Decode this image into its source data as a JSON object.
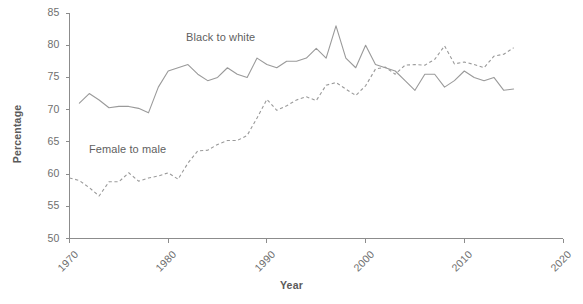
{
  "chart_data": {
    "type": "line",
    "title": "",
    "xlabel": "Year",
    "ylabel": "Percentage",
    "xlim": [
      1970,
      2020
    ],
    "ylim": [
      50,
      85
    ],
    "xticks": [
      1970,
      1980,
      1990,
      2000,
      2010,
      2020
    ],
    "yticks": [
      50,
      55,
      60,
      65,
      70,
      75,
      80,
      85
    ],
    "grid": false,
    "legend_position": "inline-annotation",
    "series": [
      {
        "name": "Black to white",
        "style": "solid",
        "color": "#9a9a9a",
        "annotation": "Black to white",
        "x": [
          1971,
          1972,
          1973,
          1974,
          1975,
          1976,
          1977,
          1978,
          1979,
          1980,
          1981,
          1982,
          1983,
          1984,
          1985,
          1986,
          1987,
          1988,
          1989,
          1990,
          1991,
          1992,
          1993,
          1994,
          1995,
          1996,
          1997,
          1998,
          1999,
          2000,
          2001,
          2002,
          2003,
          2004,
          2005,
          2006,
          2007,
          2008,
          2009,
          2010,
          2011,
          2012,
          2013,
          2014,
          2015
        ],
        "values": [
          71.0,
          72.5,
          71.5,
          70.3,
          70.5,
          70.5,
          70.2,
          69.5,
          73.5,
          76.0,
          76.5,
          77.0,
          75.5,
          74.5,
          75.0,
          76.5,
          75.5,
          75.0,
          78.0,
          77.0,
          76.5,
          77.5,
          77.5,
          78.0,
          79.5,
          78.0,
          83.0,
          78.0,
          76.5,
          80.0,
          77.0,
          76.5,
          76.0,
          74.5,
          73.0,
          75.5,
          75.5,
          73.5,
          74.5,
          76.0,
          75.0,
          74.5,
          75.0,
          73.0,
          73.2
        ]
      },
      {
        "name": "Female to male",
        "style": "dashed",
        "color": "#9a9a9a",
        "annotation": "Female to male",
        "x": [
          1970,
          1971,
          1972,
          1973,
          1974,
          1975,
          1976,
          1977,
          1978,
          1979,
          1980,
          1981,
          1982,
          1983,
          1984,
          1985,
          1986,
          1987,
          1988,
          1989,
          1990,
          1991,
          1992,
          1993,
          1994,
          1995,
          1996,
          1997,
          1998,
          1999,
          2000,
          2001,
          2002,
          2003,
          2004,
          2005,
          2006,
          2007,
          2008,
          2009,
          2010,
          2011,
          2012,
          2013,
          2014,
          2015
        ],
        "values": [
          59.4,
          59.0,
          57.9,
          56.6,
          58.8,
          58.8,
          60.2,
          58.9,
          59.4,
          59.7,
          60.2,
          59.2,
          61.7,
          63.6,
          63.7,
          64.6,
          65.2,
          65.2,
          66.0,
          68.7,
          71.6,
          69.9,
          70.6,
          71.5,
          72.0,
          71.4,
          73.8,
          74.2,
          73.2,
          72.2,
          73.7,
          76.3,
          76.6,
          75.5,
          76.9,
          77.0,
          76.9,
          77.8,
          79.9,
          77.1,
          77.4,
          77.0,
          76.5,
          78.3,
          78.6,
          79.6
        ]
      }
    ]
  },
  "axis": {
    "y_labels": [
      "85",
      "80",
      "75",
      "70",
      "65",
      "60",
      "55",
      "50"
    ],
    "x_labels": [
      "1970",
      "1980",
      "1990",
      "2000",
      "2010",
      "2020"
    ],
    "y_title": "Percentage",
    "x_title": "Year"
  },
  "annotations": {
    "black_to_white": "Black to white",
    "female_to_male": "Female to male"
  }
}
